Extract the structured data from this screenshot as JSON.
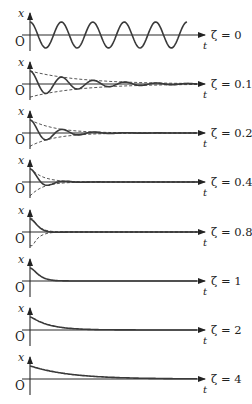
{
  "chart_data": {
    "type": "line",
    "title": "",
    "xlabel": "t",
    "ylabel": "x",
    "origin_label": "O",
    "grid": false,
    "legend": "none; each panel labeled at right",
    "panels": [
      {
        "label": "ζ = 0",
        "zeta": 0,
        "envelope": false,
        "cycles_shown": 4.5
      },
      {
        "label": "ζ = 0.1",
        "zeta": 0.1,
        "envelope": true,
        "cycles_shown": 4
      },
      {
        "label": "ζ = 0.2",
        "zeta": 0.2,
        "envelope": true,
        "cycles_shown": 2
      },
      {
        "label": "ζ = 0.4",
        "zeta": 0.4,
        "envelope": true,
        "cycles_shown": 1
      },
      {
        "label": "ζ = 0.8",
        "zeta": 0.8,
        "envelope": true,
        "cycles_shown": 0.5
      },
      {
        "label": "ζ = 1",
        "zeta": 1,
        "envelope": false,
        "cycles_shown": 0
      },
      {
        "label": "ζ = 2",
        "zeta": 2,
        "envelope": false,
        "cycles_shown": 0
      },
      {
        "label": "ζ = 4",
        "zeta": 4,
        "envelope": false,
        "cycles_shown": 0
      }
    ]
  },
  "layout": {
    "panel_axis_y": [
      35,
      84,
      133,
      182,
      232,
      281,
      330,
      379
    ],
    "y_axis_x": 30,
    "t_axis_end_x": 205,
    "amplitude_px": 13,
    "omega_per_px": 0.2
  }
}
